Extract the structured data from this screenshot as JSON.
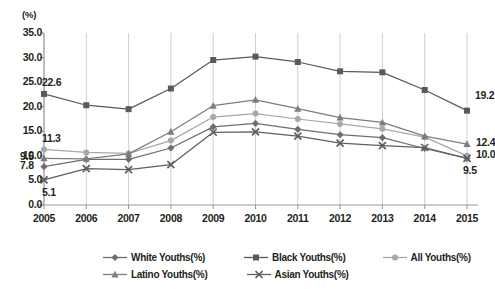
{
  "axis_unit_label": "(%)",
  "y_ticks": [
    "35.0",
    "30.0",
    "25.0",
    "20.0",
    "15.0",
    "10.0",
    "5.0",
    "0.0"
  ],
  "x_ticks": [
    "2005",
    "2006",
    "2007",
    "2008",
    "2009",
    "2010",
    "2011",
    "2012",
    "2013",
    "2014",
    "2015"
  ],
  "legend": {
    "row1": [
      {
        "label": "White Youths(%)",
        "marker": "diamond-marker-icon",
        "color": "#6e6e6e"
      },
      {
        "label": "Black Youths(%)",
        "marker": "square-marker-icon",
        "color": "#5a5a5a"
      },
      {
        "label": "All Youths(%)",
        "marker": "circle-marker-icon",
        "color": "#a8a8a8"
      }
    ],
    "row2": [
      {
        "label": "Latino Youths(%)",
        "marker": "triangle-marker-icon",
        "color": "#7d7d7d"
      },
      {
        "label": "Asian Youths(%)",
        "marker": "cross-marker-icon",
        "color": "#5f5f5f"
      }
    ]
  },
  "data_labels": [
    {
      "text": "22.6",
      "series": "Black Youths(%)",
      "year": "2005"
    },
    {
      "text": "11.3",
      "series": "All Youths(%)",
      "year": "2005"
    },
    {
      "text": "9.5",
      "series": "Latino Youths(%)",
      "year": "2005"
    },
    {
      "text": "7.8",
      "series": "White Youths(%)",
      "year": "2005"
    },
    {
      "text": "5.1",
      "series": "Asian Youths(%)",
      "year": "2005"
    },
    {
      "text": "19.2",
      "series": "Black Youths(%)",
      "year": "2015"
    },
    {
      "text": "12.4",
      "series": "Latino Youths(%)",
      "year": "2015"
    },
    {
      "text": "10.0",
      "series": "All Youths(%)",
      "year": "2015"
    },
    {
      "text": "9.5",
      "series": "Asian Youths(%)",
      "year": "2015"
    }
  ],
  "chart_data": {
    "type": "line",
    "title": "",
    "xlabel": "",
    "ylabel": "(%)",
    "ylim": [
      0.0,
      35.0
    ],
    "ytick_step": 5.0,
    "grid": "vertical",
    "legend_position": "bottom",
    "categories": [
      "2005",
      "2006",
      "2007",
      "2008",
      "2009",
      "2010",
      "2011",
      "2012",
      "2013",
      "2014",
      "2015"
    ],
    "series": [
      {
        "name": "White Youths(%)",
        "marker": "diamond",
        "color": "#6e6e6e",
        "values": [
          7.8,
          9.3,
          9.3,
          11.6,
          15.9,
          16.6,
          15.4,
          14.3,
          13.7,
          11.5,
          9.5
        ]
      },
      {
        "name": "Black Youths(%)",
        "marker": "square",
        "color": "#5a5a5a",
        "values": [
          22.6,
          20.3,
          19.5,
          23.7,
          29.5,
          30.2,
          29.1,
          27.2,
          27.0,
          23.4,
          19.2
        ]
      },
      {
        "name": "All Youths(%)",
        "marker": "circle",
        "color": "#a8a8a8",
        "values": [
          11.3,
          10.7,
          10.5,
          13.1,
          17.9,
          18.6,
          17.5,
          16.5,
          15.5,
          13.8,
          10.0
        ]
      },
      {
        "name": "Latino Youths(%)",
        "marker": "triangle",
        "color": "#7d7d7d",
        "values": [
          9.5,
          9.4,
          10.4,
          14.9,
          20.2,
          21.4,
          19.6,
          17.8,
          16.8,
          14.0,
          12.4
        ]
      },
      {
        "name": "Asian Youths(%)",
        "marker": "cross",
        "color": "#5f5f5f",
        "values": [
          5.1,
          7.4,
          7.2,
          8.2,
          14.8,
          14.9,
          14.0,
          12.6,
          12.1,
          11.7,
          9.5
        ]
      }
    ]
  }
}
